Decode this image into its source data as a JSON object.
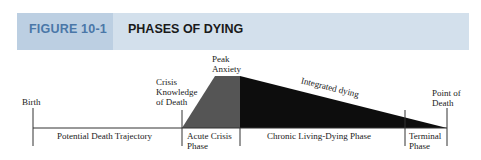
{
  "figure": {
    "number": "FIGURE 10-1",
    "title": "PHASES OF DYING"
  },
  "colors": {
    "header_band": "#d3e0ec",
    "header_label_box": "#bccfe2",
    "figure_number_text": "#4a77a8",
    "acute_fill": "#555555",
    "chronic_fill": "#0d0d0d"
  },
  "markers": {
    "birth": "Birth",
    "crisis_line1": "Crisis",
    "crisis_line2": "Knowledge",
    "crisis_line3": "of Death",
    "peak_line1": "Peak",
    "peak_line2": "Anxiety",
    "integrated": "Integrated dying",
    "death_line1": "Point of",
    "death_line2": "Death"
  },
  "phases": {
    "potential": "Potential Death Trajectory",
    "acute_line1": "Acute Crisis",
    "acute_line2": "Phase",
    "chronic": "Chronic Living-Dying Phase",
    "terminal_line1": "Terminal",
    "terminal_line2": "Phase"
  }
}
